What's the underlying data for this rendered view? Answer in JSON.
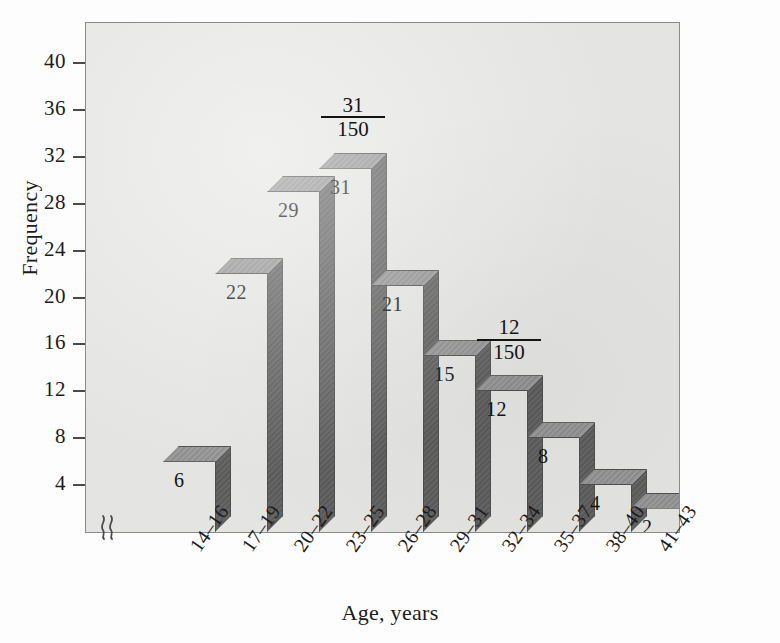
{
  "chart_data": {
    "type": "bar",
    "title": "",
    "subtitle": "",
    "xlabel": "Age, years",
    "ylabel": "Frequency",
    "categories": [
      "14–16",
      "17–19",
      "20–22",
      "23–25",
      "26–28",
      "29–31",
      "32–34",
      "35–37",
      "38–40",
      "41–43"
    ],
    "values": [
      6,
      22,
      29,
      31,
      21,
      15,
      12,
      8,
      4,
      2
    ],
    "value_labels": [
      "6",
      "22",
      "29",
      "31",
      "21",
      "15",
      "12",
      "8",
      "4",
      "2"
    ],
    "ylim": [
      0,
      42
    ],
    "yticks": [
      40,
      36,
      32,
      28,
      24,
      20,
      16,
      12,
      8,
      4
    ],
    "ytick_labels": [
      "40",
      "36",
      "32",
      "28",
      "24",
      "20",
      "16",
      "12",
      "8",
      "4"
    ],
    "grid": false,
    "legend": null,
    "axis_break": "⸮",
    "total": 150,
    "annotations": [
      {
        "category": "23–25",
        "numerator": "31",
        "denominator": "150"
      },
      {
        "category": "32–34",
        "numerator": "12",
        "denominator": "150"
      }
    ],
    "colors": {
      "bar_front": "#7c7c7c",
      "bar_top": "#909090",
      "bar_side": "#5f5f5f",
      "bar_outline": "#4f4f4f",
      "plot_background": "#e4e4e2",
      "page_background": "#fdfdfd",
      "text": "#1c1c1c",
      "axis": "#4a4a4a"
    }
  }
}
